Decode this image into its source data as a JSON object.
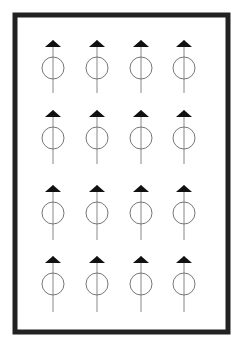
{
  "diagram": {
    "type": "symbol-grid",
    "frame": {
      "x": 15,
      "y": 15,
      "width": 213,
      "height": 317,
      "stroke": "#222222",
      "stroke_width": 5
    },
    "symbol": {
      "name": "circle-with-vertical-stem-and-triangle-cap",
      "circle_radius": 11,
      "circle_stroke": "#777777",
      "stem_stroke": "#888888",
      "triangle_fill": "#111111",
      "triangle_half_width": 8,
      "triangle_height": 7
    },
    "columns_x": [
      53,
      97,
      141,
      184
    ],
    "rows": [
      {
        "triangle_top": 40,
        "circle_cy": 68,
        "stem_bottom": 93
      },
      {
        "triangle_top": 110,
        "circle_cy": 138,
        "stem_bottom": 164
      },
      {
        "triangle_top": 185,
        "circle_cy": 213,
        "stem_bottom": 240
      },
      {
        "triangle_top": 256,
        "circle_cy": 284,
        "stem_bottom": 312
      }
    ],
    "symbol_count": 16
  }
}
